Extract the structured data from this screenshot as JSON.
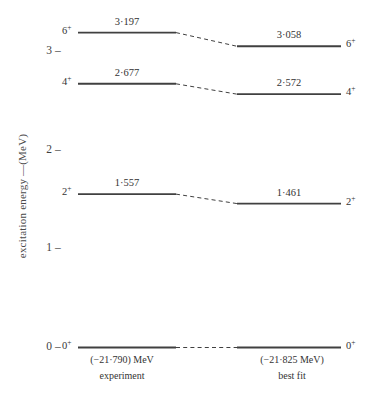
{
  "figure": {
    "title": "",
    "background_color": "#ffffff",
    "line_color": "#404040",
    "text_color": "#333333"
  },
  "axis": {
    "label": "excitation energy  —(MeV)",
    "ticks": [
      {
        "label": "0",
        "value": 0
      },
      {
        "label": "1",
        "value": 1
      },
      {
        "label": "2",
        "value": 2
      },
      {
        "label": "3",
        "value": 3
      }
    ],
    "tick_dash": "–",
    "range": [
      0,
      3.45
    ]
  },
  "columns": [
    {
      "id": "experiment",
      "binding_energy": "(−21·790) MeV",
      "caption": "experiment"
    },
    {
      "id": "best-fit",
      "binding_energy": "(−21·825  MeV)",
      "caption": "best  fit"
    }
  ],
  "chart_data": {
    "type": "line",
    "title": "",
    "xlabel": "",
    "ylabel": "excitation energy  —(MeV)",
    "ylim": [
      0,
      3.45
    ],
    "categories": [
      "experiment",
      "best fit"
    ],
    "series": [
      {
        "name": "0+",
        "spin_parity": "0",
        "parity": "+",
        "values": [
          0.0,
          0.0
        ],
        "labels": [
          "",
          ""
        ]
      },
      {
        "name": "2+",
        "spin_parity": "2",
        "parity": "+",
        "values": [
          1.557,
          1.461
        ],
        "labels": [
          "1·557",
          "1·461"
        ]
      },
      {
        "name": "4+",
        "spin_parity": "4",
        "parity": "+",
        "values": [
          2.677,
          2.572
        ],
        "labels": [
          "2·677",
          "2·572"
        ]
      },
      {
        "name": "6+",
        "spin_parity": "6",
        "parity": "+",
        "values": [
          3.197,
          3.058
        ],
        "labels": [
          "3·197",
          "3·058"
        ]
      }
    ],
    "grid": false,
    "legend": "none",
    "annotations": [
      "(−21·790) MeV",
      "experiment",
      "(−21·825  MeV)",
      "best  fit"
    ]
  },
  "levels": {
    "left": [
      {
        "id": "l0",
        "spin": "0",
        "parity": "+",
        "value_text": "",
        "energy": 0.0
      },
      {
        "id": "l2",
        "spin": "2",
        "parity": "+",
        "value_text": "1·557",
        "energy": 1.557
      },
      {
        "id": "l4",
        "spin": "4",
        "parity": "+",
        "value_text": "2·677",
        "energy": 2.677
      },
      {
        "id": "l6",
        "spin": "6",
        "parity": "+",
        "value_text": "3·197",
        "energy": 3.197
      }
    ],
    "right": [
      {
        "id": "r0",
        "spin": "0",
        "parity": "+",
        "value_text": "",
        "energy": 0.0
      },
      {
        "id": "r2",
        "spin": "2",
        "parity": "+",
        "value_text": "1·461",
        "energy": 1.461
      },
      {
        "id": "r4",
        "spin": "4",
        "parity": "+",
        "value_text": "2·572",
        "energy": 2.572
      },
      {
        "id": "r6",
        "spin": "6",
        "parity": "+",
        "value_text": "3·058",
        "energy": 3.058
      }
    ]
  }
}
